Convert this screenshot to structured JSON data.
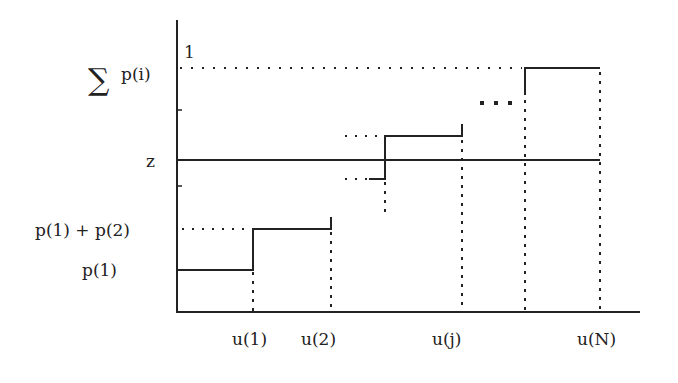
{
  "diagram": {
    "type": "step-function-cumulative-distribution",
    "y_axis_labels": {
      "top": "1",
      "sum": "p(i)",
      "sum_symbol": "∑",
      "z": "z",
      "p1p2": "p(1) + p(2)",
      "p1": "p(1)"
    },
    "x_axis_labels": [
      "u(1)",
      "u(2)",
      "u(j)",
      "u(N)"
    ],
    "ellipsis": "...",
    "colors": {
      "ink": "#222222",
      "background": "#ffffff"
    }
  }
}
